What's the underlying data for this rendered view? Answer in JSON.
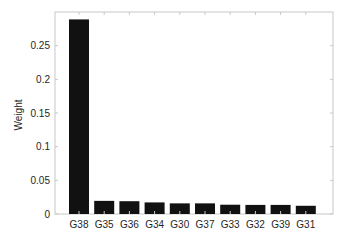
{
  "chart_data": {
    "type": "bar",
    "title": "",
    "xlabel": "",
    "ylabel": "Weight",
    "categories": [
      "G38",
      "G35",
      "G36",
      "G34",
      "G30",
      "G37",
      "G33",
      "G32",
      "G39",
      "G31"
    ],
    "values": [
      0.289,
      0.0195,
      0.019,
      0.0172,
      0.0158,
      0.0158,
      0.0138,
      0.0135,
      0.0135,
      0.0122
    ],
    "ylim": [
      0,
      0.3
    ],
    "yticks": [
      0,
      0.05,
      0.1,
      0.15,
      0.2,
      0.25
    ],
    "ytick_labels": [
      "0",
      "0.05",
      "0.1",
      "0.15",
      "0.2",
      "0.25"
    ],
    "grid": false,
    "legend": null,
    "bar_color": "#111111",
    "axes_color": "#c8c8c8"
  }
}
